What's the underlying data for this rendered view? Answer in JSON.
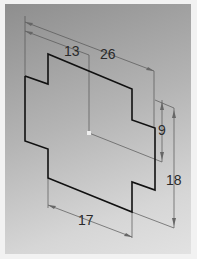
{
  "diagram": {
    "type": "isometric cad sketch",
    "dimensions": [
      {
        "id": "half_width",
        "label": "13"
      },
      {
        "id": "total_width",
        "label": "26"
      },
      {
        "id": "notch_height",
        "label": "9"
      },
      {
        "id": "total_height",
        "label": "18"
      },
      {
        "id": "bottom_width",
        "label": "17"
      }
    ],
    "colors": {
      "profile": "#111111",
      "dimension": "#555555",
      "background_top": "#8e8e8e",
      "background_bottom": "#e2e2e2"
    }
  }
}
